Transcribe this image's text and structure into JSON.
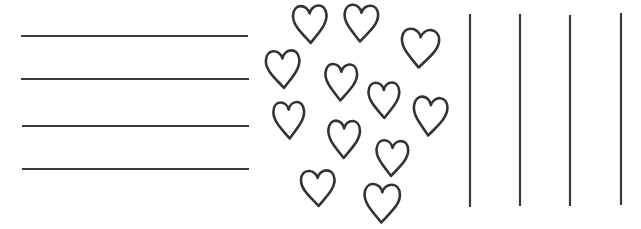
{
  "page": {
    "width": 641,
    "height": 229,
    "background_color": "#ffffff",
    "ink_color": "#333333"
  },
  "panels": {
    "left": {
      "name": "horizontal-rule-lines",
      "orientation": "horizontal",
      "count": 4,
      "stroke_color": "#3a3a3a",
      "stroke_width": 2.2
    },
    "center": {
      "name": "heart-cluster",
      "count": 12,
      "stroke_color": "#333333",
      "stroke_width": 2.6,
      "fill_color": "#ffffff"
    },
    "right": {
      "name": "vertical-rule-lines",
      "orientation": "vertical",
      "count": 4,
      "stroke_color": "#3a3a3a",
      "stroke_width": 2.2
    }
  },
  "horizontal_lines": [
    {
      "label": "horizontal-line-1",
      "x1": 21,
      "y1": 36,
      "x2": 248,
      "y2": 36
    },
    {
      "label": "horizontal-line-2",
      "x1": 21,
      "y1": 79,
      "x2": 249,
      "y2": 79
    },
    {
      "label": "horizontal-line-3",
      "x1": 22,
      "y1": 126,
      "x2": 249,
      "y2": 126
    },
    {
      "label": "horizontal-line-4",
      "x1": 22,
      "y1": 169,
      "x2": 249,
      "y2": 169
    }
  ],
  "vertical_lines": [
    {
      "label": "vertical-line-1",
      "x1": 470,
      "y1": 14,
      "x2": 470,
      "y2": 207
    },
    {
      "label": "vertical-line-2",
      "x1": 520,
      "y1": 14,
      "x2": 520,
      "y2": 206
    },
    {
      "label": "vertical-line-3",
      "x1": 570,
      "y1": 15,
      "x2": 570,
      "y2": 206
    },
    {
      "label": "vertical-line-4",
      "x1": 621,
      "y1": 13,
      "x2": 621,
      "y2": 205
    }
  ],
  "hearts": [
    {
      "label": "heart-1",
      "cx": 310,
      "cy": 23,
      "w": 36,
      "h": 40,
      "rotate": -2
    },
    {
      "label": "heart-2",
      "cx": 361,
      "cy": 22,
      "w": 36,
      "h": 39,
      "rotate": 3
    },
    {
      "label": "heart-3",
      "cx": 420,
      "cy": 47,
      "w": 40,
      "h": 41,
      "rotate": 4
    },
    {
      "label": "heart-4",
      "cx": 283,
      "cy": 68,
      "w": 36,
      "h": 40,
      "rotate": -3
    },
    {
      "label": "heart-5",
      "cx": 341,
      "cy": 81,
      "w": 34,
      "h": 39,
      "rotate": 2
    },
    {
      "label": "heart-6",
      "cx": 384,
      "cy": 99,
      "w": 33,
      "h": 38,
      "rotate": -1
    },
    {
      "label": "heart-7",
      "cx": 430,
      "cy": 115,
      "w": 36,
      "h": 41,
      "rotate": 5
    },
    {
      "label": "heart-8",
      "cx": 289,
      "cy": 119,
      "w": 33,
      "h": 39,
      "rotate": -2
    },
    {
      "label": "heart-9",
      "cx": 344,
      "cy": 138,
      "w": 34,
      "h": 40,
      "rotate": 1
    },
    {
      "label": "heart-10",
      "cx": 392,
      "cy": 157,
      "w": 34,
      "h": 38,
      "rotate": 3
    },
    {
      "label": "heart-11",
      "cx": 318,
      "cy": 187,
      "w": 36,
      "h": 38,
      "rotate": -2
    },
    {
      "label": "heart-12",
      "cx": 382,
      "cy": 202,
      "w": 38,
      "h": 41,
      "rotate": 2
    }
  ]
}
